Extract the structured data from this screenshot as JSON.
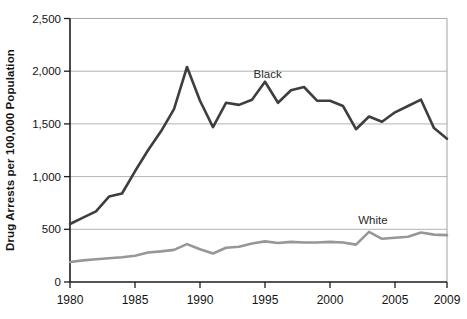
{
  "figure": {
    "background": "#ffffff"
  },
  "colors": {
    "black_line": "#3e3e40",
    "white_line": "#95979a",
    "gridline": "#b3b3b3",
    "frame": "#a9a9a9",
    "axis": "#1c1c1c",
    "text": "#131313"
  },
  "chart_data": {
    "type": "line",
    "title": "",
    "xlabel": "",
    "ylabel": "Drug Arrests per 100,000 Population",
    "xlim": [
      1980,
      2009
    ],
    "ylim": [
      0,
      2500
    ],
    "grid": "horizontal",
    "legend": "inline-labels",
    "x": [
      1980,
      1981,
      1982,
      1983,
      1984,
      1985,
      1986,
      1987,
      1988,
      1989,
      1990,
      1991,
      1992,
      1993,
      1994,
      1995,
      1996,
      1997,
      1998,
      1999,
      2000,
      2001,
      2002,
      2003,
      2004,
      2005,
      2006,
      2007,
      2008,
      2009
    ],
    "series": [
      {
        "name": "Black",
        "color": "#3e3e40",
        "values": [
          550,
          610,
          670,
          810,
          840,
          1050,
          1250,
          1430,
          1640,
          2040,
          1720,
          1470,
          1700,
          1680,
          1730,
          1900,
          1700,
          1820,
          1850,
          1720,
          1720,
          1670,
          1450,
          1570,
          1520,
          1610,
          1670,
          1730,
          1460,
          1360
        ]
      },
      {
        "name": "White",
        "color": "#95979a",
        "values": [
          190,
          205,
          215,
          225,
          235,
          250,
          280,
          290,
          305,
          360,
          310,
          270,
          325,
          335,
          365,
          385,
          370,
          380,
          375,
          375,
          380,
          375,
          355,
          475,
          410,
          420,
          430,
          470,
          450,
          445
        ]
      }
    ],
    "yticks": [
      {
        "v": 0,
        "label": "0"
      },
      {
        "v": 500,
        "label": "500"
      },
      {
        "v": 1000,
        "label": "1,000"
      },
      {
        "v": 1500,
        "label": "1,500"
      },
      {
        "v": 2000,
        "label": "2,000"
      },
      {
        "v": 2500,
        "label": "2,500"
      }
    ],
    "xticks": [
      {
        "v": 1980,
        "label": "1980"
      },
      {
        "v": 1985,
        "label": "1985"
      },
      {
        "v": 1990,
        "label": "1990"
      },
      {
        "v": 1995,
        "label": "1995"
      },
      {
        "v": 2000,
        "label": "2000"
      },
      {
        "v": 2005,
        "label": "2005"
      },
      {
        "v": 2009,
        "label": "2009"
      }
    ],
    "annotations": [
      {
        "text": "Black",
        "year": 1995.2,
        "value": 1940
      },
      {
        "text": "White",
        "year": 2003.3,
        "value": 555
      }
    ]
  }
}
